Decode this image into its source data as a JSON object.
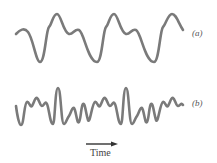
{
  "figure": {
    "waveform_a": {
      "label": "(a)",
      "description": "Periodic complex waveform, low-harmonic content",
      "periods": 3,
      "color": "#777777"
    },
    "waveform_b": {
      "label": "(b)",
      "description": "Periodic complex waveform, high-harmonic content",
      "periods": 3,
      "color": "#777777"
    },
    "axis": {
      "label": "Time",
      "arrow_direction": "right"
    }
  }
}
